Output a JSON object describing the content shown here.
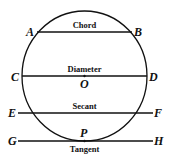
{
  "diagram": {
    "points": {
      "A": "A",
      "B": "B",
      "C": "C",
      "D": "D",
      "E": "E",
      "F": "F",
      "G": "G",
      "H": "H",
      "O": "O",
      "P": "P"
    },
    "lines": {
      "chord": "Chord",
      "diameter": "Diameter",
      "secant": "Secant",
      "tangent": "Tangent"
    },
    "colors": {
      "ink": "#111111",
      "background": "#ffffff"
    }
  }
}
